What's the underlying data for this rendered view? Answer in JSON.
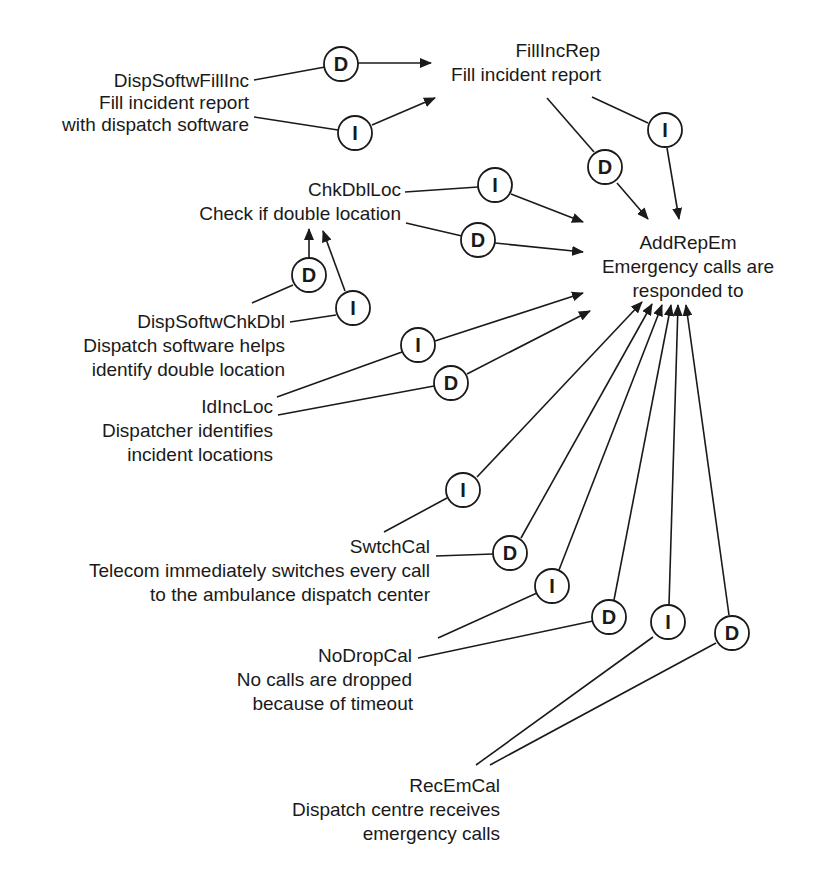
{
  "diagram": {
    "type": "goal-contribution-graph",
    "colors": {
      "ink": "#1a1a1a",
      "background": "#ffffff"
    },
    "goals": [
      {
        "id": "DispSoftwFillInc",
        "lines": [
          "DispSoftwFillInc",
          "Fill incident report",
          "with dispatch software"
        ]
      },
      {
        "id": "FillIncRep",
        "lines": [
          "FillIncRep",
          "Fill incident report"
        ]
      },
      {
        "id": "AddRepEm",
        "lines": [
          "AddRepEm",
          "Emergency calls are",
          "responded to"
        ]
      },
      {
        "id": "ChkDblLoc",
        "lines": [
          "ChkDblLoc",
          "Check if double location"
        ]
      },
      {
        "id": "DispSoftwChkDbl",
        "lines": [
          "DispSoftwChkDbl",
          "Dispatch software helps",
          "identify double location"
        ]
      },
      {
        "id": "IdIncLoc",
        "lines": [
          "IdIncLoc",
          "Dispatcher identifies",
          "incident locations"
        ]
      },
      {
        "id": "SwtchCal",
        "lines": [
          "SwtchCal",
          "Telecom immediately switches every call",
          "to the ambulance dispatch center"
        ]
      },
      {
        "id": "NoDropCal",
        "lines": [
          "NoDropCal",
          "No calls are dropped",
          "because of timeout"
        ]
      },
      {
        "id": "RecEmCal",
        "lines": [
          "RecEmCal",
          "Dispatch centre receives",
          "emergency calls"
        ]
      }
    ],
    "contributions": [
      {
        "from": "DispSoftwFillInc",
        "to": "FillIncRep",
        "type": "D"
      },
      {
        "from": "DispSoftwFillInc",
        "to": "FillIncRep",
        "type": "I"
      },
      {
        "from": "FillIncRep",
        "to": "AddRepEm",
        "type": "D"
      },
      {
        "from": "FillIncRep",
        "to": "AddRepEm",
        "type": "I"
      },
      {
        "from": "ChkDblLoc",
        "to": "AddRepEm",
        "type": "I"
      },
      {
        "from": "ChkDblLoc",
        "to": "AddRepEm",
        "type": "D"
      },
      {
        "from": "DispSoftwChkDbl",
        "to": "ChkDblLoc",
        "type": "D"
      },
      {
        "from": "DispSoftwChkDbl",
        "to": "ChkDblLoc",
        "type": "I"
      },
      {
        "from": "IdIncLoc",
        "to": "AddRepEm",
        "type": "I"
      },
      {
        "from": "IdIncLoc",
        "to": "AddRepEm",
        "type": "D"
      },
      {
        "from": "SwtchCal",
        "to": "AddRepEm",
        "type": "I"
      },
      {
        "from": "SwtchCal",
        "to": "AddRepEm",
        "type": "D"
      },
      {
        "from": "NoDropCal",
        "to": "AddRepEm",
        "type": "I"
      },
      {
        "from": "NoDropCal",
        "to": "AddRepEm",
        "type": "D"
      },
      {
        "from": "RecEmCal",
        "to": "AddRepEm",
        "type": "I"
      },
      {
        "from": "RecEmCal",
        "to": "AddRepEm",
        "type": "D"
      }
    ]
  }
}
